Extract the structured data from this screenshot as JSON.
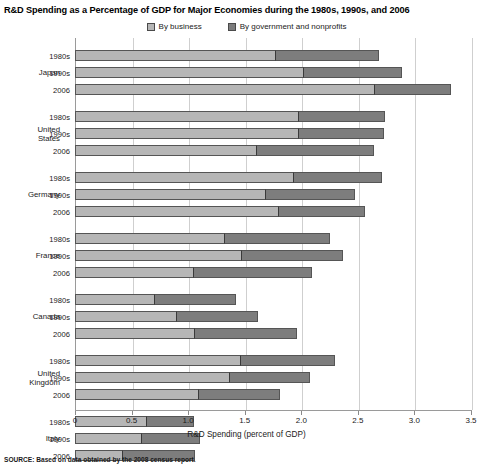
{
  "title": "R&D Spending as a Percentage of GDP for Major Economies during the 1980s, 1990s, and 2006",
  "legend": {
    "items": [
      {
        "label": "By business",
        "color": "#b6b6b6"
      },
      {
        "label": "By government and nonprofits",
        "color": "#7d7d7d"
      }
    ]
  },
  "axis": {
    "xlabel": "R&D Spending (percent of GDP)",
    "ticks": [
      "0",
      "0.5",
      "1.0",
      "1.5",
      "2.0",
      "2.5",
      "3.0",
      "3.5"
    ],
    "xmin": 0,
    "xmax": 3.5
  },
  "source": "SOURCE: Based on data obtained by the 2008 census report.",
  "chart_data": {
    "type": "bar",
    "orientation": "horizontal",
    "stacked": true,
    "title": "R&D Spending as a Percentage of GDP for Major Economies during the 1980s, 1990s, and 2006",
    "xlabel": "R&D Spending (percent of GDP)",
    "ylabel": "",
    "xlim": [
      0,
      3.5
    ],
    "grid": true,
    "legend_position": "top-center",
    "series": [
      {
        "name": "By business",
        "color": "#b6b6b6"
      },
      {
        "name": "By government and nonprofits",
        "color": "#7d7d7d"
      }
    ],
    "groups": [
      {
        "country": "Japan",
        "rows": [
          {
            "period": "1980s",
            "business": 1.78,
            "government": 0.92,
            "total": 2.7
          },
          {
            "period": "1990s",
            "business": 2.02,
            "government": 0.88,
            "total": 2.9
          },
          {
            "period": "2006",
            "business": 2.65,
            "government": 0.68,
            "total": 3.33
          }
        ]
      },
      {
        "country": "United States",
        "rows": [
          {
            "period": "1980s",
            "business": 1.98,
            "government": 0.77,
            "total": 2.75
          },
          {
            "period": "1990s",
            "business": 1.98,
            "government": 0.76,
            "total": 2.74
          },
          {
            "period": "2006",
            "business": 1.61,
            "government": 1.04,
            "total": 2.65
          }
        ]
      },
      {
        "country": "Germany",
        "rows": [
          {
            "period": "1980s",
            "business": 1.94,
            "government": 0.78,
            "total": 2.72
          },
          {
            "period": "1990s",
            "business": 1.69,
            "government": 0.79,
            "total": 2.48
          },
          {
            "period": "2006",
            "business": 1.8,
            "government": 0.77,
            "total": 2.57
          }
        ]
      },
      {
        "country": "France",
        "rows": [
          {
            "period": "1980s",
            "business": 1.33,
            "government": 0.93,
            "total": 2.26
          },
          {
            "period": "1990s",
            "business": 1.48,
            "government": 0.9,
            "total": 2.38
          },
          {
            "period": "2006",
            "business": 1.05,
            "government": 1.05,
            "total": 2.1
          }
        ]
      },
      {
        "country": "Canada",
        "rows": [
          {
            "period": "1980s",
            "business": 0.71,
            "government": 0.72,
            "total": 1.43
          },
          {
            "period": "1990s",
            "business": 0.9,
            "government": 0.73,
            "total": 1.63
          },
          {
            "period": "2006",
            "business": 1.06,
            "government": 0.91,
            "total": 1.97
          }
        ]
      },
      {
        "country": "United Kingdom",
        "rows": [
          {
            "period": "1980s",
            "business": 1.47,
            "government": 0.84,
            "total": 2.31
          },
          {
            "period": "1990s",
            "business": 1.37,
            "government": 0.72,
            "total": 2.09
          },
          {
            "period": "2006",
            "business": 1.1,
            "government": 0.72,
            "total": 1.82
          }
        ]
      },
      {
        "country": "Italy",
        "rows": [
          {
            "period": "1980s",
            "business": 0.64,
            "government": 0.42,
            "total": 1.06
          },
          {
            "period": "1990s",
            "business": 0.59,
            "government": 0.52,
            "total": 1.11
          },
          {
            "period": "2006",
            "business": 0.42,
            "government": 0.65,
            "total": 1.07
          }
        ]
      }
    ]
  }
}
